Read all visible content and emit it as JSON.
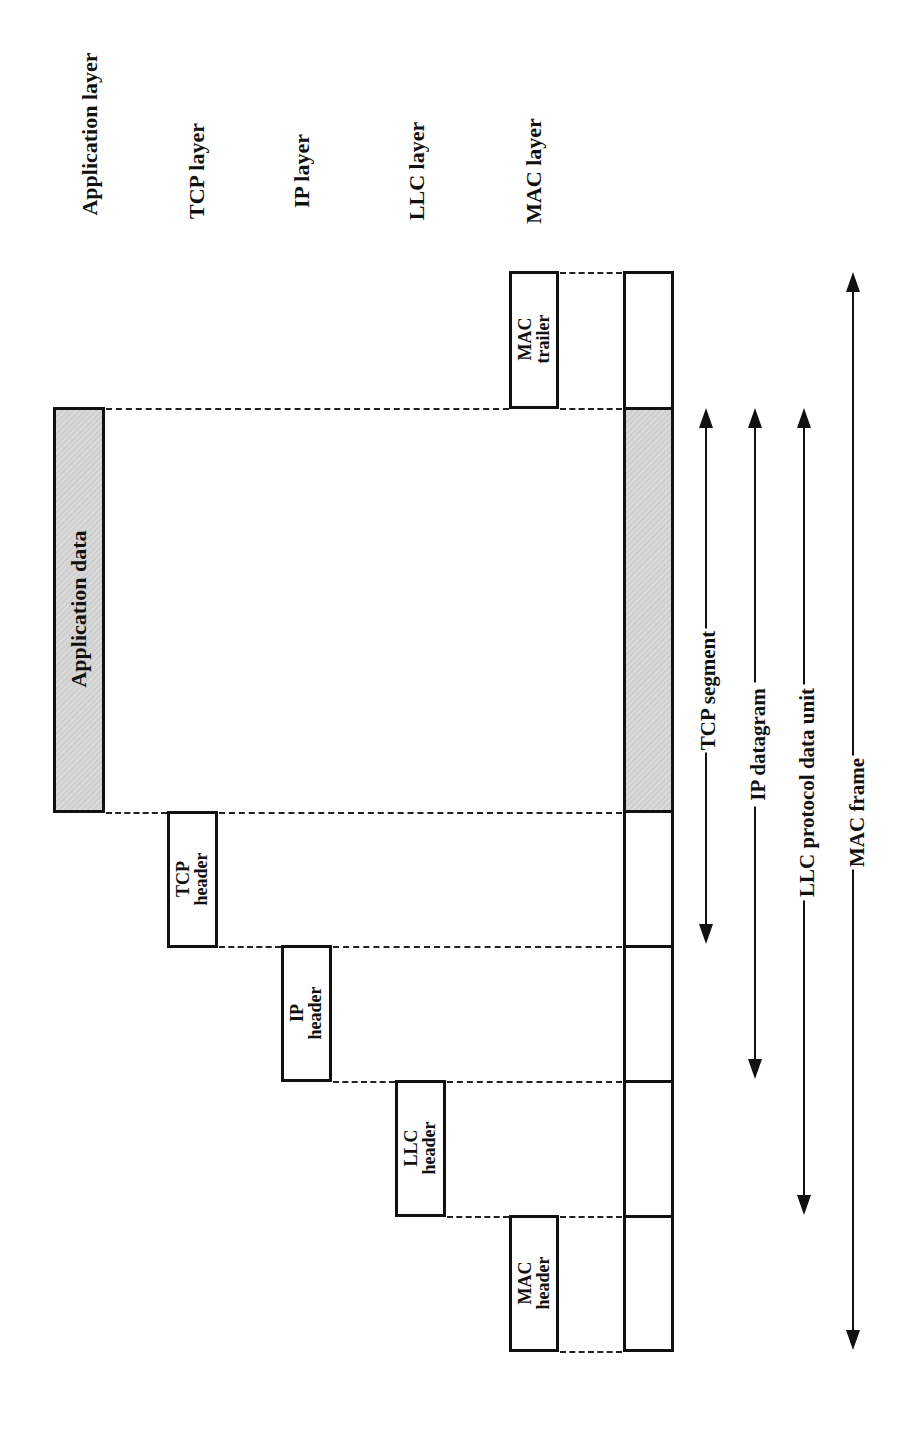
{
  "layers": {
    "application": "Application layer",
    "tcp": "TCP layer",
    "ip": "IP layer",
    "llc": "LLC layer",
    "mac": "MAC layer"
  },
  "blocks": {
    "application_data": "Application data",
    "tcp_header_l1": "TCP",
    "tcp_header_l2": "header",
    "ip_header_l1": "IP",
    "ip_header_l2": "header",
    "llc_header_l1": "LLC",
    "llc_header_l2": "header",
    "mac_header_l1": "MAC",
    "mac_header_l2": "header",
    "mac_trailer_l1": "MAC",
    "mac_trailer_l2": "trailer"
  },
  "spans": {
    "tcp_segment": "TCP segment",
    "ip_datagram": "IP datagram",
    "llc_pdu": "LLC protocol data unit",
    "mac_frame": "MAC frame"
  },
  "colors": {
    "stroke": "#111111",
    "shaded_fill": "#d4d4d4",
    "background": "#ffffff"
  }
}
